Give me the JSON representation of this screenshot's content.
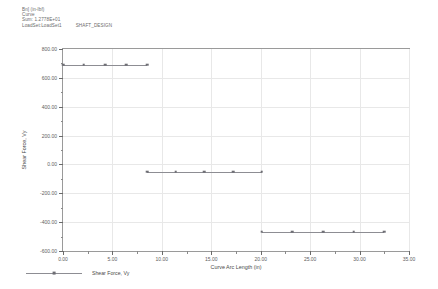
{
  "header": {
    "line1": "Bn] (in-lbf)",
    "line2": "Curve",
    "line3": "Sum: 1.2778E+01",
    "line4": "LoadSet:LoadSet1",
    "line4b": "SHAFT_DESIGN"
  },
  "legend": {
    "items": [
      {
        "label": "Shear Force, Vy",
        "color": "#8d8d93"
      }
    ]
  },
  "chart_data": {
    "type": "line",
    "title": "",
    "subtitle": "",
    "xlabel": "Curve Arc Length (in)",
    "ylabel": "Shear Force, Vy",
    "xlim": [
      0.0,
      35.0
    ],
    "ylim": [
      -600.0,
      800.0
    ],
    "xticks": [
      0.0,
      5.0,
      10.0,
      15.0,
      20.0,
      25.0,
      30.0,
      35.0
    ],
    "xtick_labels": [
      "0.00",
      "5.00",
      "10.00",
      "15.00",
      "20.00",
      "25.00",
      "30.00",
      "35.00"
    ],
    "yticks": [
      -600.0,
      -400.0,
      -200.0,
      0.0,
      200.0,
      400.0,
      600.0,
      800.0
    ],
    "ytick_labels": [
      "-600.00",
      "-400.00",
      "-200.00",
      "0.00",
      "200.00",
      "400.00",
      "600.00",
      "800.00"
    ],
    "grid": true,
    "legend_position": "bottom-left",
    "marker": "square",
    "series": [
      {
        "name": "Shear Force, Vy",
        "color": "#8d8d93",
        "segments": [
          {
            "name": "segment-1",
            "x": [
              0.0,
              2.1,
              4.25,
              6.4,
              8.5
            ],
            "y": [
              690.0,
              690.0,
              690.0,
              690.0,
              690.0
            ]
          },
          {
            "name": "segment-2",
            "x": [
              8.5,
              11.4,
              14.3,
              17.2,
              20.1
            ],
            "y": [
              -50.0,
              -50.0,
              -50.0,
              -50.0,
              -50.0
            ]
          },
          {
            "name": "segment-3",
            "x": [
              20.1,
              23.2,
              26.3,
              29.4,
              32.5
            ],
            "y": [
              -465.0,
              -465.0,
              -465.0,
              -465.0,
              -465.0
            ]
          }
        ]
      }
    ]
  }
}
